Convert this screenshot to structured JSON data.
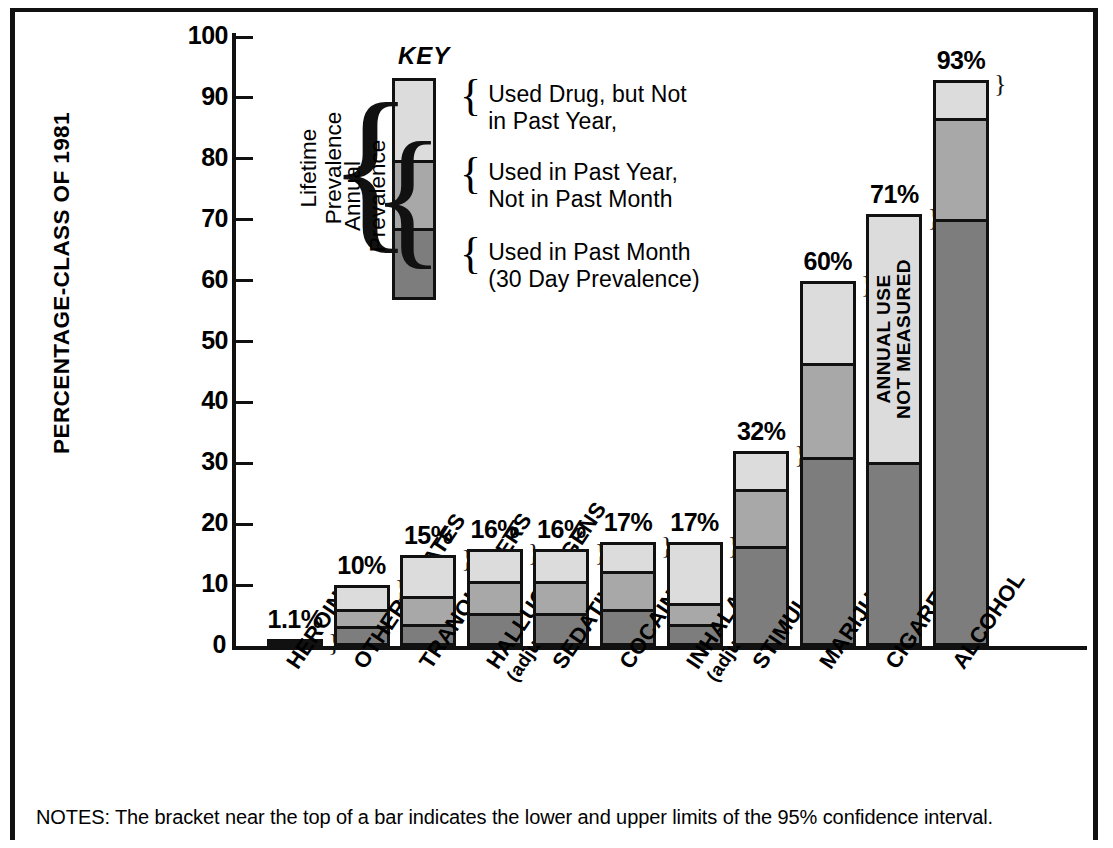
{
  "chart_data": {
    "type": "bar",
    "title": "",
    "xlabel": "",
    "ylabel": "PERCENTAGE-CLASS OF 1981",
    "ylim": [
      0,
      100
    ],
    "yticks": [
      0,
      10,
      20,
      30,
      40,
      50,
      60,
      70,
      80,
      90,
      100
    ],
    "grid": false,
    "stacked": true,
    "legend_position": "inside-top-center",
    "categories": [
      "HEROIN",
      "OTHER OPIATES",
      "TRANQUILIZERS",
      "HALLUCINOGENS (adjusted)",
      "SEDATIVES",
      "COCAINE",
      "INHALANTS (adjusted)",
      "STIMULANTS",
      "MARIJUANA",
      "CIGARETTES",
      "ALCOHOL"
    ],
    "series": [
      {
        "name": "Used in Past Month (30 Day Prevalence)",
        "color": "#7d7d7d",
        "values": [
          0.5,
          2.8,
          3.1,
          5.0,
          5.0,
          5.7,
          3.0,
          16.5,
          31.0,
          29.9,
          70.7
        ]
      },
      {
        "name": "Used in Past Year, Not in Past Month",
        "color": "#a8a8a8",
        "values": [
          0.6,
          3.0,
          4.7,
          5.5,
          5.4,
          6.5,
          3.3,
          9.4,
          15.5,
          0.0,
          16.3
        ]
      },
      {
        "name": "Used Drug, but Not in Past Year,",
        "color": "#dcdcdc",
        "values": [
          0.0,
          4.2,
          7.2,
          5.5,
          5.6,
          4.8,
          10.7,
          6.1,
          13.5,
          41.1,
          6.0
        ]
      }
    ],
    "totals": [
      1.1,
      10,
      15,
      16,
      16,
      17,
      17,
      32,
      60,
      71,
      93
    ],
    "total_labels": [
      "1.1%",
      "10%",
      "15%",
      "16%",
      "16%",
      "17%",
      "17%",
      "32%",
      "60%",
      "71%",
      "93%"
    ],
    "annotations": [
      {
        "category": "CIGARETTES",
        "text": "ANNUAL USE\nNOT MEASURED",
        "line1": "ANNUAL USE",
        "line2": "NOT MEASURED"
      }
    ]
  },
  "yaxis": {
    "label": "PERCENTAGE-CLASS OF 1981",
    "ticks": [
      "100",
      "90",
      "80",
      "70",
      "60",
      "50",
      "40",
      "30",
      "20",
      "10",
      "0"
    ]
  },
  "key": {
    "title": "KEY",
    "entries": [
      {
        "swatch": "light-gray",
        "line1": "Used Drug, but Not",
        "line2": "in Past Year,"
      },
      {
        "swatch": "medium-gray",
        "line1": "Used in Past Year,",
        "line2": "Not in Past Month"
      },
      {
        "swatch": "dark-gray",
        "line1": "Used in Past Month",
        "line2": "(30 Day Prevalence)"
      }
    ]
  },
  "prevalence_brackets": [
    {
      "line1": "Lifetime",
      "line2": "Prevalence"
    },
    {
      "line1": "Annual",
      "line2": "Prevalence"
    }
  ],
  "bars": [
    {
      "label": "HEROIN",
      "sub": "",
      "total": "1.1%",
      "dark": 0.5,
      "mid": 0.6,
      "light": 0.0
    },
    {
      "label": "OTHER OPIATES",
      "sub": "",
      "total": "10%",
      "dark": 2.8,
      "mid": 3.0,
      "light": 4.2
    },
    {
      "label": "TRANQUILIZERS",
      "sub": "",
      "total": "15%",
      "dark": 3.1,
      "mid": 4.7,
      "light": 7.2
    },
    {
      "label": "HALLUCINOGENS",
      "sub": "(adjusted)",
      "total": "16%",
      "dark": 5.0,
      "mid": 5.5,
      "light": 5.5
    },
    {
      "label": "SEDATIVES",
      "sub": "",
      "total": "16%",
      "dark": 5.0,
      "mid": 5.4,
      "light": 5.6
    },
    {
      "label": "COCAINE",
      "sub": "",
      "total": "17%",
      "dark": 5.7,
      "mid": 6.5,
      "light": 4.8
    },
    {
      "label": "INHALANTS",
      "sub": "(adjusted)",
      "total": "17%",
      "dark": 3.0,
      "mid": 3.3,
      "light": 10.7
    },
    {
      "label": "STIMULANTS",
      "sub": "",
      "total": "32%",
      "dark": 16.5,
      "mid": 9.4,
      "light": 6.1
    },
    {
      "label": "MARIJUANA",
      "sub": "",
      "total": "60%",
      "dark": 31.0,
      "mid": 15.5,
      "light": 13.5
    },
    {
      "label": "CIGARETTES",
      "sub": "",
      "total": "71%",
      "dark": 29.9,
      "mid": 0.0,
      "light": 41.1,
      "note1": "ANNUAL USE",
      "note2": "NOT MEASURED"
    },
    {
      "label": "ALCOHOL",
      "sub": "",
      "total": "93%",
      "dark": 70.7,
      "mid": 16.3,
      "light": 6.0
    }
  ],
  "notes": {
    "text": "NOTES: The bracket near the top of a bar indicates the lower and upper limits of the 95% confidence interval."
  },
  "colors": {
    "light": "#dcdcdc",
    "medium": "#a8a8a8",
    "dark": "#7d7d7d",
    "outline": "#111111"
  }
}
